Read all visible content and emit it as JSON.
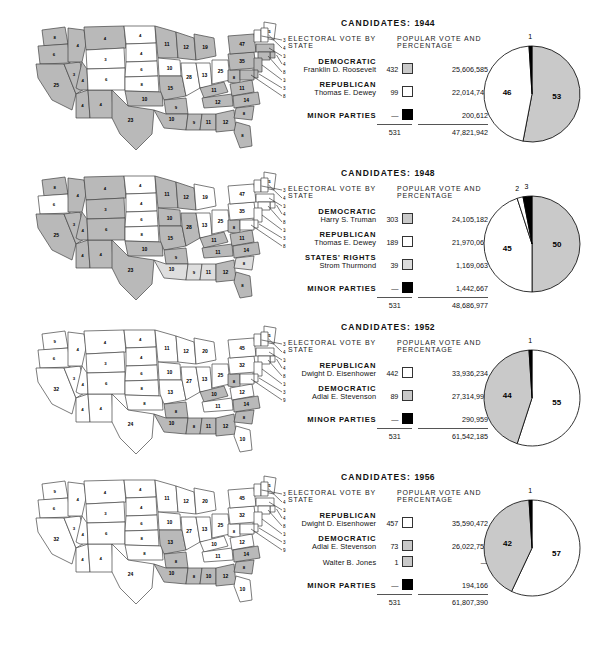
{
  "chart_data": [
    {
      "type": "pie",
      "title": "CANDIDATES: 1944",
      "year": "1944",
      "labels": [
        "Democratic",
        "Republican",
        "Minor Parties"
      ],
      "values": [
        53,
        46,
        1
      ],
      "colors": [
        "#c9c9c9",
        "#ffffff",
        "#000000"
      ],
      "tick_labels": [
        "53",
        "46",
        "1"
      ],
      "legend_position": "inside-slices"
    },
    {
      "type": "pie",
      "title": "CANDIDATES: 1948",
      "year": "1948",
      "labels": [
        "Democratic",
        "Republican",
        "States' Rights",
        "Minor Parties"
      ],
      "values": [
        50,
        45,
        2,
        3
      ],
      "colors": [
        "#c9c9c9",
        "#ffffff",
        "#ffffff",
        "#000000"
      ],
      "tick_labels": [
        "50",
        "45",
        "2",
        "3"
      ],
      "legend_position": "inside-slices"
    },
    {
      "type": "pie",
      "title": "CANDIDATES: 1952",
      "year": "1952",
      "labels": [
        "Republican",
        "Democratic",
        "Minor Parties"
      ],
      "values": [
        55,
        44,
        1
      ],
      "colors": [
        "#ffffff",
        "#c9c9c9",
        "#000000"
      ],
      "tick_labels": [
        "55",
        "44",
        "1"
      ],
      "legend_position": "inside-slices"
    },
    {
      "type": "pie",
      "title": "CANDIDATES: 1956",
      "year": "1956",
      "labels": [
        "Republican",
        "Democratic",
        "Minor Parties"
      ],
      "values": [
        57,
        42,
        1
      ],
      "colors": [
        "#ffffff",
        "#c9c9c9",
        "#000000"
      ],
      "tick_labels": [
        "57",
        "42",
        "1"
      ],
      "legend_position": "inside-slices"
    }
  ],
  "panels": [
    {
      "title_prefix": "CANDIDATES:",
      "year": "1944",
      "col_left": "ELECTORAL VOTE BY STATE",
      "col_right": "POPULAR VOTE AND PERCENTAGE",
      "rows": [
        {
          "party": "DEMOCRATIC",
          "person": "Franklin D. Roosevelt",
          "ev": "432",
          "swatch": "gray",
          "pv": "25,606,585"
        },
        {
          "party": "REPUBLICAN",
          "person": "Thomas E. Dewey",
          "ev": "99",
          "swatch": "white",
          "pv": "22,014,745"
        },
        {
          "party": "MINOR PARTIES",
          "person": "",
          "ev": "—",
          "swatch": "black",
          "pv": "200,612"
        }
      ],
      "total_ev": "531",
      "total_pv": "47,821,942"
    },
    {
      "title_prefix": "CANDIDATES:",
      "year": "1948",
      "col_left": "ELECTORAL VOTE BY STATE",
      "col_right": "POPULAR VOTE AND PERCENTAGE",
      "rows": [
        {
          "party": "DEMOCRATIC",
          "person": "Harry S. Truman",
          "ev": "303",
          "swatch": "gray",
          "pv": "24,105,182"
        },
        {
          "party": "REPUBLICAN",
          "person": "Thomas E. Dewey",
          "ev": "189",
          "swatch": "white",
          "pv": "21,970,065"
        },
        {
          "party": "STATES' RIGHTS",
          "person": "Strom Thurmond",
          "ev": "39",
          "swatch": "light",
          "pv": "1,169,063"
        },
        {
          "party": "MINOR PARTIES",
          "person": "",
          "ev": "—",
          "swatch": "black",
          "pv": "1,442,667"
        }
      ],
      "total_ev": "531",
      "total_pv": "48,686,977"
    },
    {
      "title_prefix": "CANDIDATES:",
      "year": "1952",
      "col_left": "ELECTORAL VOTE BY STATE",
      "col_right": "POPULAR VOTE AND PERCENTAGE",
      "rows": [
        {
          "party": "REPUBLICAN",
          "person": "Dwight D. Eisenhower",
          "ev": "442",
          "swatch": "white",
          "pv": "33,936,234"
        },
        {
          "party": "DEMOCRATIC",
          "person": "Adlai E. Stevenson",
          "ev": "89",
          "swatch": "gray",
          "pv": "27,314,992"
        },
        {
          "party": "MINOR PARTIES",
          "person": "",
          "ev": "—",
          "swatch": "black",
          "pv": "290,959"
        }
      ],
      "total_ev": "531",
      "total_pv": "61,542,185"
    },
    {
      "title_prefix": "CANDIDATES:",
      "year": "1956",
      "col_left": "ELECTORAL VOTE BY STATE",
      "col_right": "POPULAR VOTE AND PERCENTAGE",
      "rows": [
        {
          "party": "REPUBLICAN",
          "person": "Dwight D. Eisenhower",
          "ev": "457",
          "swatch": "white",
          "pv": "35,590,472"
        },
        {
          "party": "DEMOCRATIC",
          "person": "Adlai E. Stevenson",
          "ev": "73",
          "swatch": "gray",
          "pv": "26,022,752"
        },
        {
          "party": "",
          "person": "Walter B. Jones",
          "ev": "1",
          "swatch": "gray",
          "pv": "—"
        },
        {
          "party": "MINOR PARTIES",
          "person": "",
          "ev": "—",
          "swatch": "black",
          "pv": "194,166"
        }
      ],
      "total_ev": "531",
      "total_pv": "61,807,390"
    }
  ],
  "maps": [
    {
      "year": "1944",
      "states": {
        "WA": "8",
        "OR": "6",
        "CA": "25",
        "NV": "3",
        "ID": "4",
        "MT": "4",
        "WY": "3",
        "UT": "4",
        "AZ": "4",
        "NM": "4",
        "CO": "6",
        "ND": "4",
        "SD": "4",
        "NE": "6",
        "KS": "8",
        "OK": "10",
        "TX": "23",
        "MN": "11",
        "IA": "10",
        "MO": "15",
        "AR": "9",
        "LA": "10",
        "WI": "12",
        "IL": "28",
        "MS": "9",
        "AL": "11",
        "MI": "19",
        "IN": "13",
        "KY": "11",
        "TN": "12",
        "GA": "12",
        "FL": "8",
        "OH": "25",
        "WV": "8",
        "VA": "11",
        "NC": "14",
        "SC": "8",
        "PA": "35",
        "NY": "47",
        "ME": "5",
        "VT": "3",
        "NH": "4",
        "MA": "16",
        "RI": "4",
        "CT": "8",
        "NJ": "16",
        "DE": "3",
        "MD": "8"
      },
      "shading": {
        "gray": [
          "WA",
          "OR",
          "CA",
          "NV",
          "ID",
          "MT",
          "UT",
          "AZ",
          "NM",
          "OK",
          "TX",
          "MN",
          "MO",
          "AR",
          "LA",
          "MI",
          "MS",
          "AL",
          "KY",
          "TN",
          "GA",
          "FL",
          "WV",
          "VA",
          "NC",
          "SC",
          "PA",
          "NY",
          "MA",
          "RI",
          "CT",
          "NJ",
          "DE",
          "MD",
          "WI"
        ],
        "white": [
          "WY",
          "CO",
          "ND",
          "SD",
          "NE",
          "KS",
          "IA",
          "IL",
          "IN",
          "OH",
          "ME",
          "VT",
          "NH"
        ]
      }
    },
    {
      "year": "1948",
      "states": {
        "WA": "8",
        "OR": "6",
        "CA": "25",
        "NV": "3",
        "ID": "4",
        "MT": "4",
        "WY": "3",
        "UT": "4",
        "AZ": "4",
        "NM": "4",
        "CO": "6",
        "ND": "4",
        "SD": "4",
        "NE": "6",
        "KS": "8",
        "OK": "10",
        "TX": "23",
        "MN": "11",
        "IA": "10",
        "MO": "15",
        "AR": "9",
        "LA": "10",
        "WI": "12",
        "IL": "28",
        "MS": "9",
        "AL": "11",
        "MI": "19",
        "IN": "13",
        "KY": "11",
        "TN": "11",
        "GA": "12",
        "FL": "8",
        "OH": "25",
        "WV": "8",
        "VA": "11",
        "NC": "14",
        "SC": "8",
        "PA": "35",
        "NY": "47",
        "ME": "5",
        "VT": "3",
        "NH": "4",
        "MA": "16",
        "RI": "4",
        "CT": "8",
        "NJ": "16",
        "DE": "3",
        "MD": "8"
      },
      "shading": {
        "gray": [
          "WA",
          "CA",
          "NV",
          "ID",
          "MT",
          "WY",
          "UT",
          "AZ",
          "NM",
          "OK",
          "TX",
          "MN",
          "IA",
          "MO",
          "AR",
          "WI",
          "IL",
          "KY",
          "TN",
          "GA",
          "FL",
          "WV",
          "VA",
          "NC",
          "TX",
          "CO"
        ],
        "light": [
          "LA",
          "MS",
          "AL",
          "SC"
        ],
        "white": [
          "OR",
          "ND",
          "SD",
          "NE",
          "KS",
          "MI",
          "IN",
          "OH",
          "PA",
          "NY",
          "ME",
          "VT",
          "NH",
          "MA",
          "RI",
          "CT",
          "NJ",
          "DE",
          "MD"
        ]
      }
    },
    {
      "year": "1952",
      "states": {
        "WA": "9",
        "OR": "6",
        "CA": "32",
        "NV": "3",
        "ID": "4",
        "MT": "4",
        "WY": "3",
        "UT": "4",
        "AZ": "4",
        "NM": "4",
        "CO": "6",
        "ND": "4",
        "SD": "4",
        "NE": "6",
        "KS": "8",
        "OK": "8",
        "TX": "24",
        "MN": "11",
        "IA": "10",
        "MO": "13",
        "AR": "8",
        "LA": "10",
        "WI": "12",
        "IL": "27",
        "MS": "8",
        "AL": "11",
        "MI": "20",
        "IN": "13",
        "KY": "10",
        "TN": "11",
        "GA": "12",
        "FL": "10",
        "OH": "25",
        "WV": "8",
        "VA": "12",
        "NC": "14",
        "SC": "8",
        "PA": "32",
        "NY": "45",
        "ME": "5",
        "VT": "3",
        "NH": "4",
        "MA": "16",
        "RI": "4",
        "CT": "8",
        "NJ": "16",
        "DE": "3",
        "MD": "9"
      },
      "shading": {
        "gray": [
          "AR",
          "LA",
          "MS",
          "AL",
          "GA",
          "SC",
          "NC",
          "WV",
          "KY"
        ],
        "white": [
          "WA",
          "OR",
          "CA",
          "NV",
          "ID",
          "MT",
          "WY",
          "UT",
          "AZ",
          "NM",
          "CO",
          "ND",
          "SD",
          "NE",
          "KS",
          "OK",
          "TX",
          "MN",
          "IA",
          "MO",
          "WI",
          "IL",
          "MI",
          "IN",
          "TN",
          "FL",
          "OH",
          "VA",
          "PA",
          "NY",
          "ME",
          "VT",
          "NH",
          "MA",
          "RI",
          "CT",
          "NJ",
          "DE",
          "MD"
        ]
      }
    },
    {
      "year": "1956",
      "states": {
        "WA": "9",
        "OR": "6",
        "CA": "32",
        "NV": "3",
        "ID": "4",
        "MT": "4",
        "WY": "3",
        "UT": "4",
        "AZ": "4",
        "NM": "4",
        "CO": "6",
        "ND": "4",
        "SD": "4",
        "NE": "6",
        "KS": "8",
        "OK": "8",
        "TX": "24",
        "MN": "11",
        "IA": "10",
        "MO": "13",
        "AR": "8",
        "LA": "10",
        "WI": "12",
        "IL": "27",
        "MS": "8",
        "AL": "10",
        "MI": "20",
        "IN": "13",
        "KY": "10",
        "TN": "11",
        "GA": "12",
        "FL": "10",
        "OH": "25",
        "WV": "8",
        "VA": "12",
        "NC": "14",
        "SC": "8",
        "PA": "32",
        "NY": "45",
        "ME": "5",
        "VT": "3",
        "NH": "4",
        "MA": "16",
        "RI": "4",
        "CT": "8",
        "NJ": "16",
        "DE": "3",
        "MD": "9"
      },
      "shading": {
        "gray": [
          "MO",
          "AR",
          "LA",
          "MS",
          "AL",
          "GA",
          "SC",
          "NC"
        ],
        "white": [
          "WA",
          "OR",
          "CA",
          "NV",
          "ID",
          "MT",
          "WY",
          "UT",
          "AZ",
          "NM",
          "CO",
          "ND",
          "SD",
          "NE",
          "KS",
          "OK",
          "TX",
          "MN",
          "IA",
          "WI",
          "IL",
          "MI",
          "IN",
          "KY",
          "TN",
          "FL",
          "OH",
          "WV",
          "VA",
          "PA",
          "NY",
          "ME",
          "VT",
          "NH",
          "MA",
          "RI",
          "CT",
          "NJ",
          "DE",
          "MD"
        ]
      }
    }
  ]
}
